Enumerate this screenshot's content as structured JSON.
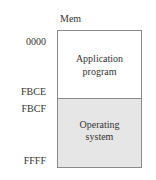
{
  "diagram": {
    "header": "Mem",
    "addresses": {
      "a0000": "0000",
      "fbce": "FBCE",
      "fbcf": "FBCF",
      "ffff": "FFFF"
    },
    "regions": [
      {
        "line1": "Application",
        "line2": "program",
        "fill": "#ffffff"
      },
      {
        "line1": "Operating",
        "line2": "system",
        "fill": "#e6e6e6"
      }
    ]
  }
}
